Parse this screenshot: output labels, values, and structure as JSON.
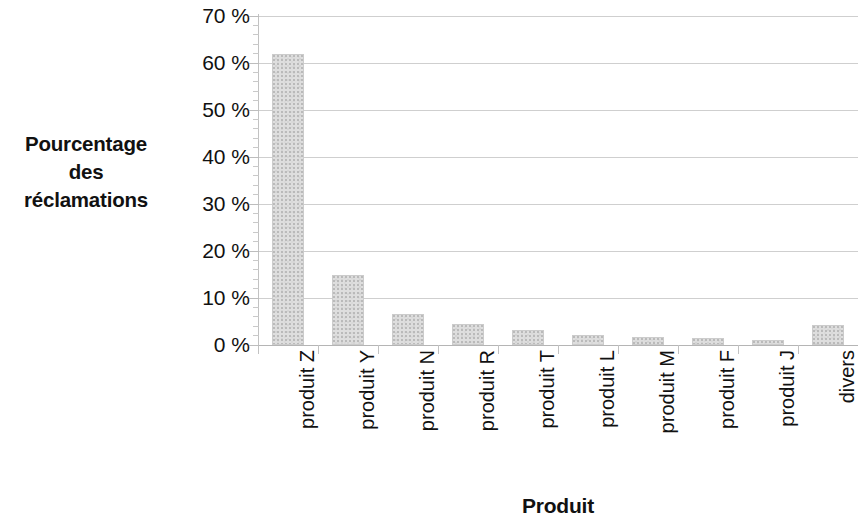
{
  "chart_data": {
    "type": "bar",
    "title": "",
    "xlabel": "Produit",
    "ylabel": "Pourcentage des réclamations",
    "ylabel_lines": [
      "Pourcentage",
      "des",
      "réclamations"
    ],
    "categories": [
      "produit Z",
      "produit Y",
      "produit N",
      "produit R",
      "produit T",
      "produit L",
      "produit M",
      "produit F",
      "produit J",
      "divers"
    ],
    "values": [
      62,
      15,
      6.5,
      4.5,
      3.2,
      2.2,
      1.7,
      1.4,
      1.0,
      4.3
    ],
    "ylim": [
      0,
      70
    ],
    "ytick_values": [
      0,
      10,
      20,
      30,
      40,
      50,
      60,
      70
    ],
    "ytick_labels": [
      "0 %",
      "10 %",
      "20 %",
      "30 %",
      "40 %",
      "50 %",
      "60 %",
      "70 %"
    ],
    "grid": true,
    "legend": false,
    "bar_color": "#dedede",
    "bar_edge_color": "#cccccc",
    "grid_color": "#cfcfcf",
    "text_color": "#111111",
    "background": "#ffffff"
  }
}
